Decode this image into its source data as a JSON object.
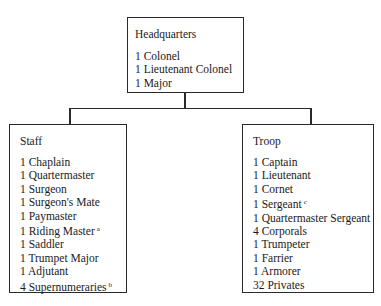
{
  "diagram": {
    "type": "organization-chart",
    "headquarters": {
      "title": "Headquarters",
      "items": [
        {
          "label": "1 Colonel",
          "note": ""
        },
        {
          "label": "1 Lieutenant Colonel",
          "note": ""
        },
        {
          "label": "1 Major",
          "note": ""
        }
      ]
    },
    "staff": {
      "title": "Staff",
      "items": [
        {
          "label": "1 Chaplain",
          "note": ""
        },
        {
          "label": "1 Quartermaster",
          "note": ""
        },
        {
          "label": "1 Surgeon",
          "note": ""
        },
        {
          "label": "1 Surgeon's Mate",
          "note": ""
        },
        {
          "label": "1 Paymaster",
          "note": ""
        },
        {
          "label": "1 Riding Master",
          "note": "a"
        },
        {
          "label": "1 Saddler",
          "note": ""
        },
        {
          "label": "1 Trumpet Major",
          "note": ""
        },
        {
          "label": "1 Adjutant",
          "note": ""
        },
        {
          "label": "4 Supernumeraries",
          "note": "b"
        }
      ]
    },
    "troop": {
      "title": "Troop",
      "items": [
        {
          "label": "1 Captain",
          "note": ""
        },
        {
          "label": "1 Lieutenant",
          "note": ""
        },
        {
          "label": "1 Cornet",
          "note": ""
        },
        {
          "label": "1 Sergeant",
          "note": "c"
        },
        {
          "label": "1 Quartermaster Sergeant",
          "note": ""
        },
        {
          "label": "4 Corporals",
          "note": ""
        },
        {
          "label": "1 Trumpeter",
          "note": ""
        },
        {
          "label": "1 Farrier",
          "note": ""
        },
        {
          "label": "1 Armorer",
          "note": ""
        },
        {
          "label": "32 Privates",
          "note": ""
        }
      ]
    },
    "edges": [
      {
        "from": "Headquarters",
        "to": "Staff"
      },
      {
        "from": "Headquarters",
        "to": "Troop"
      }
    ],
    "colors": {
      "line": "#2a2a2a",
      "text": "#1a1a1a",
      "background": "#ffffff"
    }
  }
}
